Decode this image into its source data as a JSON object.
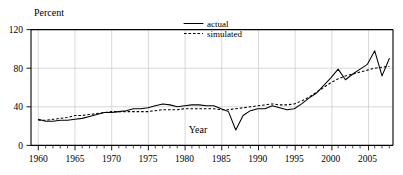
{
  "chart_data": {
    "type": "line",
    "title": "",
    "ylabel": "Percent",
    "xlabel": "Year",
    "xlim": [
      1959,
      2008.5
    ],
    "ylim": [
      0,
      120
    ],
    "yticks": [
      0,
      40,
      80,
      120
    ],
    "xticks": [
      1960,
      1965,
      1970,
      1975,
      1980,
      1985,
      1990,
      1995,
      2000,
      2005
    ],
    "xtick_labels": [
      "1960",
      "1965",
      "1970",
      "1975",
      "1980",
      "1985",
      "1990",
      "1995",
      "2000",
      "2005"
    ],
    "ytick_labels": [
      "0",
      "40",
      "80",
      "120"
    ],
    "grid": "light gray vertical at each 5-year tick, horizontal at 40 and 80",
    "minor_tick_interval": 1,
    "legend_position": "top-right inside plot",
    "legend": [
      "actual",
      "simulated"
    ],
    "x": [
      1960,
      1961,
      1962,
      1963,
      1964,
      1965,
      1966,
      1967,
      1968,
      1969,
      1970,
      1971,
      1972,
      1973,
      1974,
      1975,
      1976,
      1977,
      1978,
      1979,
      1980,
      1981,
      1982,
      1983,
      1984,
      1985,
      1986,
      1987,
      1988,
      1989,
      1990,
      1991,
      1992,
      1993,
      1994,
      1995,
      1996,
      1997,
      1998,
      1999,
      2000,
      2001,
      2002,
      2003,
      2004,
      2005,
      2006,
      2007,
      2008
    ],
    "series": [
      {
        "name": "actual",
        "style": "solid",
        "color": "#000000",
        "values": [
          27,
          25,
          25,
          26,
          26,
          27,
          28,
          30,
          32,
          34,
          34,
          35,
          36,
          38,
          38,
          39,
          41,
          43,
          42,
          40,
          41,
          42,
          42,
          41,
          41,
          38,
          35,
          16,
          31,
          36,
          38,
          38,
          41,
          39,
          37,
          38,
          43,
          49,
          54,
          62,
          70,
          79,
          68,
          74,
          79,
          84,
          98,
          72,
          90
        ]
      },
      {
        "name": "simulated",
        "style": "dashed",
        "color": "#000000",
        "values": [
          26,
          26,
          27,
          28,
          29,
          31,
          31,
          32,
          33,
          34,
          35,
          35,
          35,
          35,
          35,
          35,
          36,
          37,
          37,
          37,
          38,
          38,
          38,
          38,
          38,
          37,
          37,
          38,
          39,
          40,
          41,
          42,
          43,
          42,
          42,
          43,
          46,
          50,
          55,
          60,
          65,
          69,
          72,
          74,
          76,
          78,
          80,
          81,
          82
        ]
      }
    ]
  },
  "axes": {
    "y_title": "Percent",
    "x_title": "Year"
  },
  "legend": {
    "items": [
      {
        "label": "actual",
        "style": "solid"
      },
      {
        "label": "simulated",
        "style": "dashed"
      }
    ]
  }
}
